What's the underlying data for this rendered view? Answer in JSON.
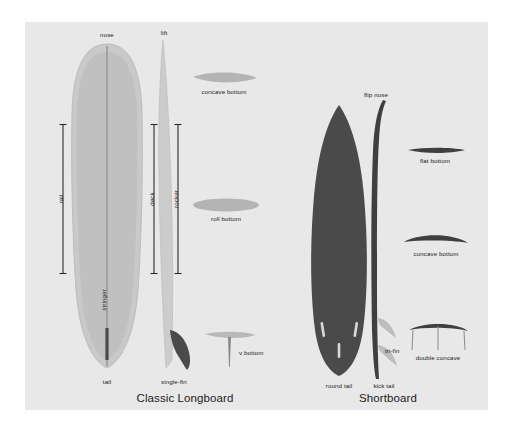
{
  "figure": {
    "background_color": "#ffffff",
    "panel_color": "#e8e8e8",
    "board_light_color": "#c9c9c9",
    "board_mid_color": "#b9b9b9",
    "board_dark_color": "#4a4a4a",
    "profile_light_color": "#cccccc",
    "text_color": "#1b1b1b"
  },
  "longboard": {
    "title": "Classic Longboard",
    "labels": {
      "nose": "nose",
      "tail": "tail",
      "rail": "rail",
      "stringer": "stringer",
      "deck": "deck",
      "rocker": "rocker",
      "lift": "lift",
      "single_fin": "single-fin"
    },
    "bottom_contours": [
      {
        "name": "concave bottom",
        "label": "concave bottom"
      },
      {
        "name": "roll bottom",
        "label": "roll bottom"
      },
      {
        "name": "v bottom",
        "label": "v bottom"
      }
    ]
  },
  "shortboard": {
    "title": "Shortboard",
    "labels": {
      "flip_nose": "flip nose",
      "round_tail": "round tail",
      "kick_tail": "kick tail",
      "tri_fin": "tri-fin"
    },
    "bottom_contours": [
      {
        "name": "flat bottom",
        "label": "flat bottom"
      },
      {
        "name": "concave bottom",
        "label": "concave bottom"
      },
      {
        "name": "double concave",
        "label": "double concave"
      }
    ]
  }
}
